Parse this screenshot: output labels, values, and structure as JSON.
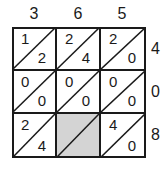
{
  "puzzle": {
    "type": "lattice-multiplication",
    "top_digits": [
      "3",
      "6",
      "5"
    ],
    "right_digits": [
      "4",
      "0",
      "8"
    ],
    "rows": [
      [
        {
          "tens": "1",
          "ones": "2",
          "shaded": false
        },
        {
          "tens": "2",
          "ones": "4",
          "shaded": false
        },
        {
          "tens": "2",
          "ones": "0",
          "shaded": false
        }
      ],
      [
        {
          "tens": "0",
          "ones": "0",
          "shaded": false
        },
        {
          "tens": "0",
          "ones": "0",
          "shaded": false
        },
        {
          "tens": "0",
          "ones": "0",
          "shaded": false
        }
      ],
      [
        {
          "tens": "2",
          "ones": "4",
          "shaded": false
        },
        {
          "tens": "",
          "ones": "",
          "shaded": true
        },
        {
          "tens": "4",
          "ones": "0",
          "shaded": false
        }
      ]
    ],
    "colors": {
      "line": "#1a1a1a",
      "shaded": "#d4d4d4",
      "background": "#ffffff"
    }
  }
}
